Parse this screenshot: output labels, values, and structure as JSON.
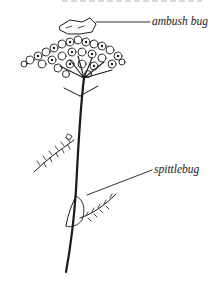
{
  "figure": {
    "labels": [
      {
        "id": "ambush-bug",
        "text": "ambush bug"
      },
      {
        "id": "spittlebug",
        "text": "spittlebug"
      }
    ]
  },
  "colors": {
    "ink": "#1a1a1a",
    "background": "#ffffff"
  }
}
